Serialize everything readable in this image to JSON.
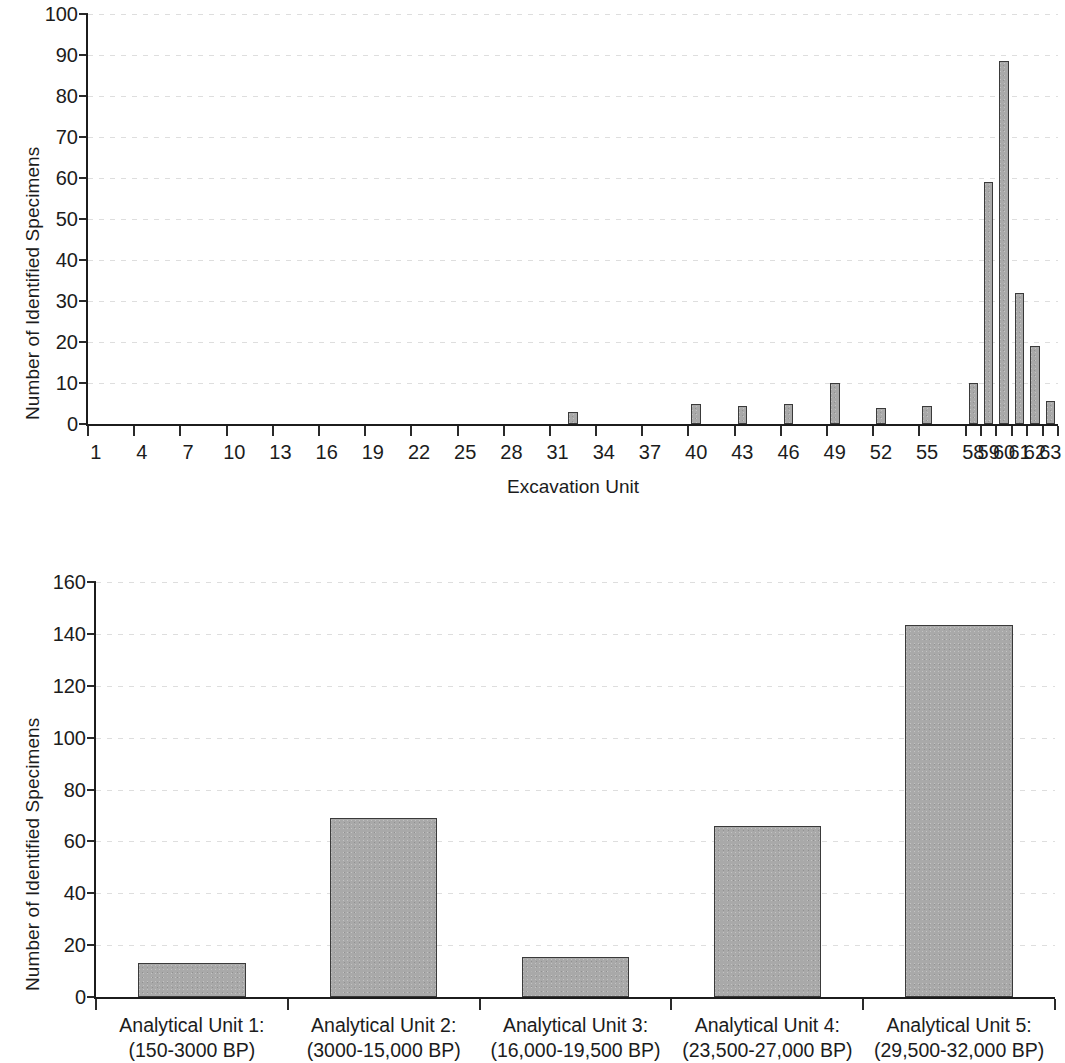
{
  "figure": {
    "background_color": "#ffffff",
    "bar_fill_color": "#a9a9a9",
    "bar_border_color": "#3a3a3a",
    "axis_color": "#1c1c1c"
  },
  "chart_data": [
    {
      "id": "excavation-unit-chart",
      "type": "bar",
      "title": "",
      "xlabel": "Excavation Unit",
      "ylabel": "Number of Identified Specimens",
      "ylim": [
        0,
        100
      ],
      "ytick_values": [
        0,
        10,
        20,
        30,
        40,
        50,
        60,
        70,
        80,
        90,
        100
      ],
      "ytick_labels": [
        "0",
        "10",
        "20",
        "30",
        "40",
        "50",
        "60",
        "70",
        "80",
        "90",
        "100"
      ],
      "xtick_labels": [
        "1",
        "4",
        "7",
        "10",
        "13",
        "16",
        "19",
        "22",
        "25",
        "28",
        "31",
        "34",
        "37",
        "40",
        "43",
        "46",
        "49",
        "52",
        "55",
        "58",
        "59",
        "60",
        "61",
        "62",
        "63"
      ],
      "grid": true,
      "legend": "none",
      "categories": [
        "1",
        "2",
        "3",
        "4",
        "5",
        "6",
        "7",
        "8",
        "9",
        "10",
        "11",
        "12",
        "13",
        "14",
        "15",
        "16",
        "17",
        "18",
        "19",
        "20",
        "21",
        "22",
        "23",
        "24",
        "25",
        "26",
        "27",
        "28",
        "29",
        "30",
        "31",
        "32",
        "33",
        "34",
        "35",
        "36",
        "37",
        "38",
        "39",
        "40",
        "41",
        "42",
        "43",
        "44",
        "45",
        "46",
        "47",
        "48",
        "49",
        "50",
        "51",
        "52",
        "53",
        "54",
        "55",
        "56",
        "57",
        "58",
        "59",
        "60",
        "61",
        "62",
        "63"
      ],
      "values": [
        0,
        0,
        0,
        0,
        0,
        0,
        0,
        0,
        0,
        0,
        0,
        0,
        0,
        0,
        0,
        0,
        0,
        0,
        0,
        0,
        0,
        0,
        0,
        0,
        0,
        0,
        0,
        0,
        0,
        0,
        0,
        3,
        0,
        0,
        0,
        0,
        0,
        0,
        0,
        5,
        0,
        0,
        4.5,
        0,
        0,
        5,
        0,
        0,
        10,
        0,
        0,
        4,
        0,
        0,
        4.5,
        0,
        0,
        10,
        59,
        88.5,
        32,
        19,
        5.5
      ]
    },
    {
      "id": "analytical-unit-chart",
      "type": "bar",
      "title": "",
      "xlabel": "",
      "ylabel": "Number of Identified Specimens",
      "ylim": [
        0,
        160
      ],
      "ytick_values": [
        0,
        20,
        40,
        60,
        80,
        100,
        120,
        140,
        160
      ],
      "ytick_labels": [
        "0",
        "20",
        "40",
        "60",
        "80",
        "100",
        "120",
        "140",
        "160"
      ],
      "grid": true,
      "legend": "none",
      "categories": [
        "Analytical Unit 1:\n(150-3000 BP)",
        "Analytical Unit 2:\n(3000-15,000 BP)",
        "Analytical Unit 3:\n(16,000-19,500 BP)",
        "Analytical Unit 4:\n(23,500-27,000 BP)",
        "Analytical Unit 5:\n(29,500-32,000 BP)"
      ],
      "category_lines": [
        [
          "Analytical Unit 1:",
          "(150-3000 BP)"
        ],
        [
          "Analytical Unit 2:",
          "(3000-15,000 BP)"
        ],
        [
          "Analytical Unit 3:",
          "(16,000-19,500 BP)"
        ],
        [
          "Analytical Unit 4:",
          "(23,500-27,000 BP)"
        ],
        [
          "Analytical Unit 5:",
          "(29,500-32,000 BP)"
        ]
      ],
      "values": [
        13,
        69,
        15.5,
        66,
        143.5
      ]
    }
  ]
}
